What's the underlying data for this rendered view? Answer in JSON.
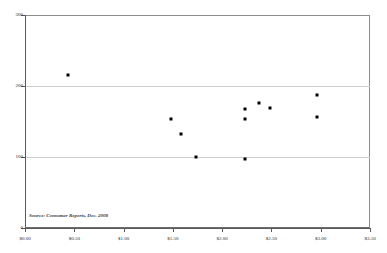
{
  "chart_data": {
    "type": "scatter",
    "title": "",
    "subtitle": "",
    "xlabel": "",
    "ylabel": "",
    "xlim": [
      0.0,
      3.5
    ],
    "ylim": [
      0,
      300
    ],
    "grid": "horizontal",
    "legend": "none",
    "x_tick_labels": [
      "$0.00",
      "$0.50",
      "$1.00",
      "$1.50",
      "$2.00",
      "$2.50",
      "$3.00",
      "$3.50"
    ],
    "x_tick_values": [
      0.0,
      0.5,
      1.0,
      1.5,
      2.0,
      2.5,
      3.0,
      3.5
    ],
    "y_tick_labels": [
      "0",
      "100",
      "200",
      "300"
    ],
    "y_tick_values": [
      0,
      100,
      200,
      300
    ],
    "gridline_values": [
      100,
      200
    ],
    "points": [
      {
        "x": 0.44,
        "y": 215
      },
      {
        "x": 1.48,
        "y": 153
      },
      {
        "x": 1.58,
        "y": 132
      },
      {
        "x": 1.73,
        "y": 100
      },
      {
        "x": 2.23,
        "y": 167
      },
      {
        "x": 2.23,
        "y": 153
      },
      {
        "x": 2.23,
        "y": 97
      },
      {
        "x": 2.37,
        "y": 176
      },
      {
        "x": 2.49,
        "y": 169
      },
      {
        "x": 2.96,
        "y": 187
      },
      {
        "x": 2.96,
        "y": 156
      }
    ],
    "annotations": [
      {
        "text": "Source: Consumer Reports, Dec. 2008",
        "x": 0.04,
        "y": 22
      }
    ],
    "colors": {
      "point": "#000000",
      "gridline": "#cfcfcf",
      "axis": "#5a5a5a",
      "frame": "#8c8c8c",
      "background": "#ffffff",
      "text": "#2b2b2b"
    }
  },
  "source_note": "Source: Consumer Reports, Dec. 2008"
}
